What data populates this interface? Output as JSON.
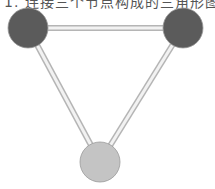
{
  "caption": {
    "text": "1. 连接三个节点构成的三角形图",
    "note": "clipped at top edge"
  },
  "graph": {
    "nodes": [
      {
        "id": "top-left",
        "cx": 28,
        "cy": 28,
        "r": 20,
        "fill": "#5b5b5b"
      },
      {
        "id": "top-right",
        "cx": 183,
        "cy": 28,
        "r": 20,
        "fill": "#5b5b5b"
      },
      {
        "id": "bottom",
        "cx": 100,
        "cy": 162,
        "r": 20,
        "fill": "#c4c4c4"
      }
    ],
    "edges": [
      {
        "from": "top-left",
        "to": "top-right"
      },
      {
        "from": "top-left",
        "to": "bottom"
      },
      {
        "from": "top-right",
        "to": "bottom"
      }
    ],
    "edge_style": {
      "outer_color": "#b5b5b5",
      "inner_color": "#f2f2f2",
      "outer_width": 6,
      "inner_width": 3
    },
    "node_stroke": "#9a9a9a"
  }
}
